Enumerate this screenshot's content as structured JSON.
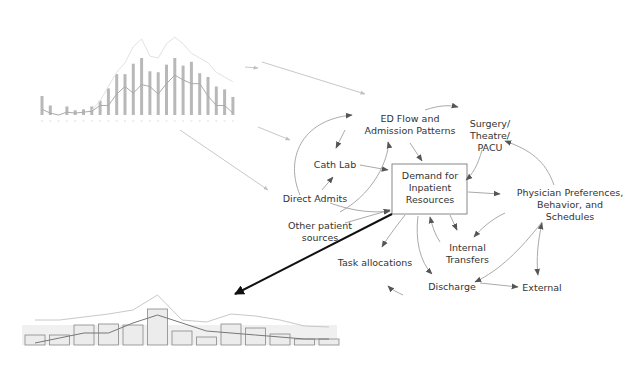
{
  "diagram": {
    "center_node": {
      "label_lines": [
        "Demand for",
        "Inpatient",
        "Resources"
      ]
    },
    "nodes": [
      {
        "id": "ed_flow",
        "label_lines": [
          "ED Flow and",
          "Admission Patterns"
        ]
      },
      {
        "id": "surgery",
        "label_lines": [
          "Surgery/",
          "Theatre/",
          "PACU"
        ]
      },
      {
        "id": "cath_lab",
        "label_lines": [
          "Cath Lab"
        ]
      },
      {
        "id": "direct_admits",
        "label_lines": [
          "Direct Admits"
        ]
      },
      {
        "id": "other_sources",
        "label_lines": [
          "Other patient",
          "sources"
        ]
      },
      {
        "id": "physician",
        "label_lines": [
          "Physician Preferences,",
          "Behavior, and",
          "Schedules"
        ]
      },
      {
        "id": "internal_transfers",
        "label_lines": [
          "Internal",
          "Transfers"
        ]
      },
      {
        "id": "task_allocations",
        "label_lines": [
          "Task allocations"
        ]
      },
      {
        "id": "discharge",
        "label_lines": [
          "Discharge"
        ]
      },
      {
        "id": "external",
        "label_lines": [
          "External"
        ]
      }
    ],
    "colors": {
      "arrow": "#555555",
      "faint_arrow": "#c8c8c8",
      "bold_arrow": "#111111",
      "text": "#333333"
    }
  },
  "chart_data": [
    {
      "type": "bar",
      "title": "",
      "xlabel": "",
      "ylabel": "",
      "grid": false,
      "categories": [
        "1",
        "2",
        "3",
        "4",
        "5",
        "6",
        "7",
        "8",
        "9",
        "10",
        "11",
        "12",
        "13",
        "14",
        "15",
        "16",
        "17",
        "18",
        "19",
        "20",
        "21",
        "22",
        "23",
        "24",
        "25",
        "26",
        "27",
        "28",
        "29"
      ],
      "series": [
        {
          "name": "bars",
          "values": [
            20,
            10,
            0,
            9,
            5,
            6,
            9,
            15,
            28,
            43,
            43,
            54,
            60,
            46,
            45,
            53,
            60,
            52,
            56,
            44,
            40,
            30,
            27,
            19,
            0,
            0,
            0,
            0,
            0
          ]
        },
        {
          "name": "line-dark",
          "values": [
            6,
            2,
            0,
            3,
            2,
            3,
            4,
            10,
            10,
            22,
            30,
            23,
            32,
            30,
            22,
            33,
            42,
            37,
            33,
            33,
            20,
            10,
            10,
            2,
            0,
            0,
            0,
            0,
            0
          ]
        },
        {
          "name": "line-light",
          "values": [
            0,
            0,
            0,
            0,
            0,
            0,
            5,
            15,
            30,
            45,
            55,
            72,
            80,
            62,
            60,
            75,
            82,
            75,
            65,
            60,
            55,
            45,
            40,
            35,
            0,
            0,
            0,
            0,
            0
          ]
        }
      ]
    },
    {
      "type": "bar",
      "title": "",
      "xlabel": "",
      "ylabel": "",
      "grid": false,
      "categories": [
        "1",
        "2",
        "3",
        "4",
        "5",
        "6",
        "7",
        "8",
        "9",
        "10",
        "11",
        "12",
        "13"
      ],
      "series": [
        {
          "name": "bars",
          "values": [
            10,
            10,
            20,
            21,
            20,
            36,
            14,
            8,
            21,
            17,
            11,
            6,
            6
          ]
        },
        {
          "name": "line-dark",
          "values": [
            0,
            5,
            10,
            10,
            20,
            28,
            20,
            12,
            10,
            8,
            6,
            4,
            4
          ]
        },
        {
          "name": "line-light",
          "values": [
            22,
            22,
            25,
            28,
            32,
            47,
            22,
            20,
            28,
            26,
            22,
            16,
            15
          ]
        }
      ]
    }
  ]
}
